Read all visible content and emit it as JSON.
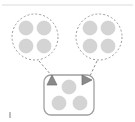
{
  "figure": {
    "name": "grouping-diagram",
    "background_color": "#ffffff",
    "width": 135,
    "height": 122
  },
  "style": {
    "dot_fill": "#d4d4d4",
    "dot_stroke": "#c9c9c9",
    "group_stroke": "#9a9a9a",
    "box_stroke": "#a0a0a0",
    "box_fill": "#ffffff",
    "connector_stroke": "#8f8f8f",
    "arrow_fill": "#8a8a8a",
    "arrow_stroke": "#6f6f6f",
    "top_rule_stroke": "#ededed",
    "corner_mark_fill": "#c0c0c0"
  },
  "top_rule": {
    "label": "top-divider",
    "x1": 2,
    "y1": 5,
    "x2": 133,
    "y2": 5
  },
  "corner_mark": {
    "label": "bottom-left-mark",
    "x": 9,
    "y": 112,
    "width": 2,
    "height": 6
  },
  "groups": [
    {
      "id": "group-left",
      "label": "Left group",
      "shape": "dashed-circle",
      "cx": 35,
      "cy": 37,
      "r": 23,
      "dot_count": 4,
      "dot_radius": 7,
      "dots": [
        {
          "id": "left-dot-1",
          "cx": 26,
          "cy": 28
        },
        {
          "id": "left-dot-2",
          "cx": 44,
          "cy": 28
        },
        {
          "id": "left-dot-3",
          "cx": 26,
          "cy": 46
        },
        {
          "id": "left-dot-4",
          "cx": 44,
          "cy": 46
        }
      ]
    },
    {
      "id": "group-right",
      "label": "Right group",
      "shape": "dashed-circle",
      "cx": 99,
      "cy": 37,
      "r": 23,
      "dot_count": 4,
      "dot_radius": 7,
      "dots": [
        {
          "id": "right-dot-1",
          "cx": 90,
          "cy": 28
        },
        {
          "id": "right-dot-2",
          "cx": 108,
          "cy": 28
        },
        {
          "id": "right-dot-3",
          "cx": 90,
          "cy": 46
        },
        {
          "id": "right-dot-4",
          "cx": 108,
          "cy": 46
        }
      ]
    }
  ],
  "container": {
    "id": "result-box",
    "label": "Result container",
    "shape": "rounded-rect",
    "x": 44,
    "y": 75,
    "width": 50,
    "height": 40,
    "radius": 7,
    "dot_count": 3,
    "dot_radius": 7,
    "dots": [
      {
        "id": "box-dot-1",
        "cx": 69,
        "cy": 87
      },
      {
        "id": "box-dot-2",
        "cx": 59,
        "cy": 103
      },
      {
        "id": "box-dot-3",
        "cx": 80,
        "cy": 103
      }
    ]
  },
  "connectors": [
    {
      "id": "connector-left",
      "label": "Left group to container",
      "style": "dashed",
      "x1": 39,
      "y1": 61,
      "x2": 52,
      "y2": 76
    },
    {
      "id": "connector-right",
      "label": "Right group to container",
      "style": "dashed",
      "x1": 97,
      "y1": 61,
      "x2": 90,
      "y2": 76
    }
  ],
  "arrows": [
    {
      "id": "arrow-left",
      "label": "Left arrow marker",
      "direction": "up",
      "glyph": "triangle-up",
      "cx": 52,
      "cy": 80,
      "size": 5
    },
    {
      "id": "arrow-right",
      "label": "Right arrow marker",
      "direction": "right",
      "glyph": "triangle-right",
      "cx": 87,
      "cy": 80,
      "size": 5
    }
  ]
}
